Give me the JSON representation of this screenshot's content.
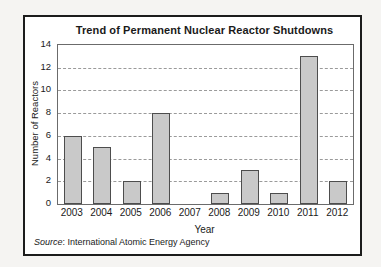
{
  "chart_data": {
    "type": "bar",
    "title": "Trend of Permanent Nuclear Reactor Shutdowns",
    "categories": [
      "2003",
      "2004",
      "2005",
      "2006",
      "2007",
      "2008",
      "2009",
      "2010",
      "2011",
      "2012"
    ],
    "values": [
      6,
      5,
      2,
      8,
      0,
      1,
      3,
      1,
      13,
      2
    ],
    "xlabel": "Year",
    "ylabel": "Number of Reactors",
    "ylim": [
      0,
      14
    ],
    "yticks": [
      0,
      2,
      4,
      6,
      8,
      10,
      12,
      14
    ],
    "grid": "horizontal-dashed",
    "legend": "none",
    "annotations": [
      "Source: International Atomic Energy Agency"
    ]
  },
  "source": {
    "label": "Source",
    "text": ": International Atomic Energy Agency"
  },
  "colors": {
    "bar_fill": "#c9c9c9",
    "bar_border": "#4d4d4d",
    "gridline": "#9a9a9a",
    "plot_border": "#6b6b6b",
    "frame_border": "#1c1c1c",
    "text": "#1a1a1a",
    "background": "#ffffff"
  }
}
